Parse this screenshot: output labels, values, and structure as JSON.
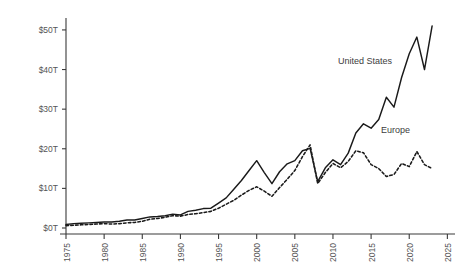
{
  "chart_data": {
    "type": "line",
    "title": "",
    "subtitle": "",
    "xlabel": "",
    "ylabel": "",
    "xlim": [
      1975,
      2026
    ],
    "ylim": [
      0,
      52
    ],
    "grid": false,
    "legend_position": "inline-annotation",
    "x_ticks": [
      "1975",
      "1980",
      "1985",
      "1990",
      "1995",
      "2000",
      "2005",
      "2010",
      "2015",
      "2020",
      "2025"
    ],
    "x_tick_values": [
      1975,
      1980,
      1985,
      1990,
      1995,
      2000,
      2005,
      2010,
      2015,
      2020,
      2025
    ],
    "y_ticks": [
      "$0T",
      "$10T",
      "$20T",
      "$30T",
      "$40T",
      "$50T"
    ],
    "y_tick_values": [
      0,
      10,
      20,
      30,
      40,
      50
    ],
    "value_unit": "trillion USD",
    "x": [
      1975,
      1976,
      1977,
      1978,
      1979,
      1980,
      1981,
      1982,
      1983,
      1984,
      1985,
      1986,
      1987,
      1988,
      1989,
      1990,
      1991,
      1992,
      1993,
      1994,
      1995,
      1996,
      1997,
      1998,
      1999,
      2000,
      2001,
      2002,
      2003,
      2004,
      2005,
      2006,
      2007,
      2008,
      2009,
      2010,
      2011,
      2012,
      2013,
      2014,
      2015,
      2016,
      2017,
      2018,
      2019,
      2020,
      2021,
      2022,
      2023
    ],
    "series": [
      {
        "name": "United States",
        "style": "solid",
        "color": "#1a1a1a",
        "label_x": 2014.2,
        "label_y": 41.5,
        "values": [
          0.9,
          1.1,
          1.2,
          1.3,
          1.4,
          1.5,
          1.5,
          1.7,
          2.0,
          2.0,
          2.4,
          2.8,
          2.9,
          3.1,
          3.5,
          3.3,
          4.2,
          4.5,
          4.9,
          5.0,
          6.3,
          7.6,
          9.8,
          12.0,
          14.5,
          17.0,
          14.0,
          11.2,
          14.2,
          16.2,
          17.0,
          19.5,
          20.1,
          11.7,
          15.2,
          17.2,
          16.0,
          18.9,
          24.0,
          26.3,
          25.2,
          27.4,
          33.0,
          30.5,
          38.0,
          44.0,
          48.2,
          40.0,
          51.0
        ]
      },
      {
        "name": "Europe",
        "style": "dashed",
        "color": "#1a1a1a",
        "label_x": 2018.2,
        "label_y": 24.0,
        "values": [
          0.6,
          0.7,
          0.8,
          0.9,
          1.0,
          1.1,
          1.0,
          1.1,
          1.3,
          1.4,
          1.7,
          2.2,
          2.4,
          2.7,
          3.1,
          3.0,
          3.4,
          3.6,
          3.9,
          4.2,
          5.0,
          6.0,
          7.0,
          8.3,
          9.5,
          10.4,
          9.3,
          8.0,
          10.2,
          12.3,
          14.5,
          18.0,
          21.0,
          11.2,
          14.0,
          16.3,
          15.2,
          16.8,
          19.5,
          19.0,
          16.0,
          15.0,
          13.0,
          13.5,
          16.3,
          15.5,
          19.3,
          16.0,
          15.0
        ]
      }
    ]
  }
}
